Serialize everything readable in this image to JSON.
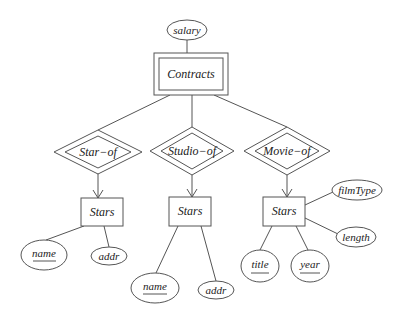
{
  "diagram": {
    "type": "er-diagram",
    "colors": {
      "stroke": "#555555",
      "text": "#222222",
      "background": "#ffffff"
    },
    "attributes_top": [
      {
        "id": "salary",
        "label": "salary",
        "key": false
      }
    ],
    "entities": [
      {
        "id": "contracts",
        "label": "Contracts",
        "weak": true
      },
      {
        "id": "stars_left",
        "label": "Stars",
        "weak": false
      },
      {
        "id": "stars_mid",
        "label": "Stars",
        "weak": false
      },
      {
        "id": "stars_right",
        "label": "Stars",
        "weak": false
      }
    ],
    "relationships": [
      {
        "id": "star_of",
        "label": "Star−of",
        "identifying": true
      },
      {
        "id": "studio_of",
        "label": "Studio−of",
        "identifying": true
      },
      {
        "id": "movie_of",
        "label": "Movie−of",
        "identifying": true
      }
    ],
    "attributes": {
      "left": [
        {
          "label": "name",
          "key": true
        },
        {
          "label": "addr",
          "key": false
        }
      ],
      "mid": [
        {
          "label": "name",
          "key": true
        },
        {
          "label": "addr",
          "key": false
        }
      ],
      "right": [
        {
          "label": "title",
          "key": true
        },
        {
          "label": "year",
          "key": true
        },
        {
          "label": "filmType",
          "key": false
        },
        {
          "label": "length",
          "key": false
        }
      ]
    }
  }
}
